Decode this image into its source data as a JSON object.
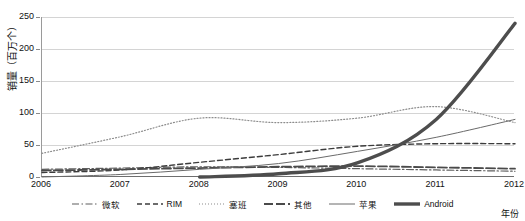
{
  "chart_title_fragment": "",
  "axes": {
    "ylabel": "销量（百万个）",
    "xlabel": "年份",
    "yticks": [
      "0",
      "50",
      "100",
      "150",
      "200",
      "250"
    ],
    "xticks": [
      "2006",
      "2007",
      "2008",
      "2009",
      "2010",
      "2011",
      "2012"
    ]
  },
  "legend": {
    "items": [
      {
        "label": "微软",
        "style": "dash-dot",
        "color": "#5f5f5f",
        "width": 1.2
      },
      {
        "label": "RIM",
        "style": "dashed",
        "color": "#3c3c3c",
        "width": 1.4
      },
      {
        "label": "塞班",
        "style": "dotted",
        "color": "#8c8c8c",
        "width": 1.2
      },
      {
        "label": "其他",
        "style": "long-dash",
        "color": "#4a4a4a",
        "width": 1.8
      },
      {
        "label": "苹果",
        "style": "solid",
        "color": "#6a6a6a",
        "width": 1.0
      },
      {
        "label": "Android",
        "style": "solid",
        "color": "#4d4d4d",
        "width": 3.4
      }
    ]
  },
  "chart_data": {
    "type": "line",
    "title": "",
    "xlabel": "年份",
    "ylabel": "销量（百万个）",
    "xlim": [
      2006,
      2012
    ],
    "ylim": [
      0,
      250
    ],
    "ytick_step": 50,
    "grid": true,
    "legend_position": "bottom",
    "x": [
      2006,
      2007,
      2008,
      2009,
      2010,
      2011,
      2012
    ],
    "series": [
      {
        "name": "微软",
        "values": [
          12,
          14,
          16,
          15,
          13,
          11,
          9
        ]
      },
      {
        "name": "RIM",
        "values": [
          7,
          11,
          23,
          35,
          48,
          52,
          52
        ]
      },
      {
        "name": "塞班",
        "values": [
          37,
          63,
          92,
          85,
          92,
          110,
          85
        ]
      },
      {
        "name": "其他",
        "values": [
          10,
          12,
          14,
          16,
          17,
          15,
          13
        ]
      },
      {
        "name": "苹果",
        "values": [
          0,
          4,
          12,
          21,
          40,
          62,
          90
        ]
      },
      {
        "name": "Android",
        "values": [
          0,
          0,
          0,
          5,
          22,
          90,
          240
        ]
      }
    ]
  }
}
